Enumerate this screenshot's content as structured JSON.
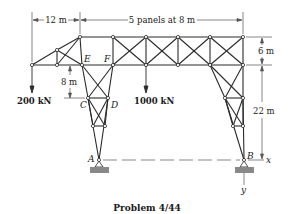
{
  "figure": {
    "caption": "Problem 4/44"
  },
  "dimensions": {
    "left_span": "12 m",
    "panels": "5 panels at 8 m",
    "top_depth": "6 m",
    "tower_height": "22 m",
    "cd_offset": "8 m"
  },
  "loads": {
    "left_load": "200 kN",
    "center_load": "1000 kN"
  },
  "joints": {
    "A": "A",
    "B": "B",
    "C": "C",
    "D": "D",
    "E": "E",
    "F": "F"
  },
  "axes": {
    "x": "x",
    "y": "y"
  },
  "colors": {
    "member": "#2a2a2a",
    "support": "#888888",
    "dim_line": "#555555"
  }
}
